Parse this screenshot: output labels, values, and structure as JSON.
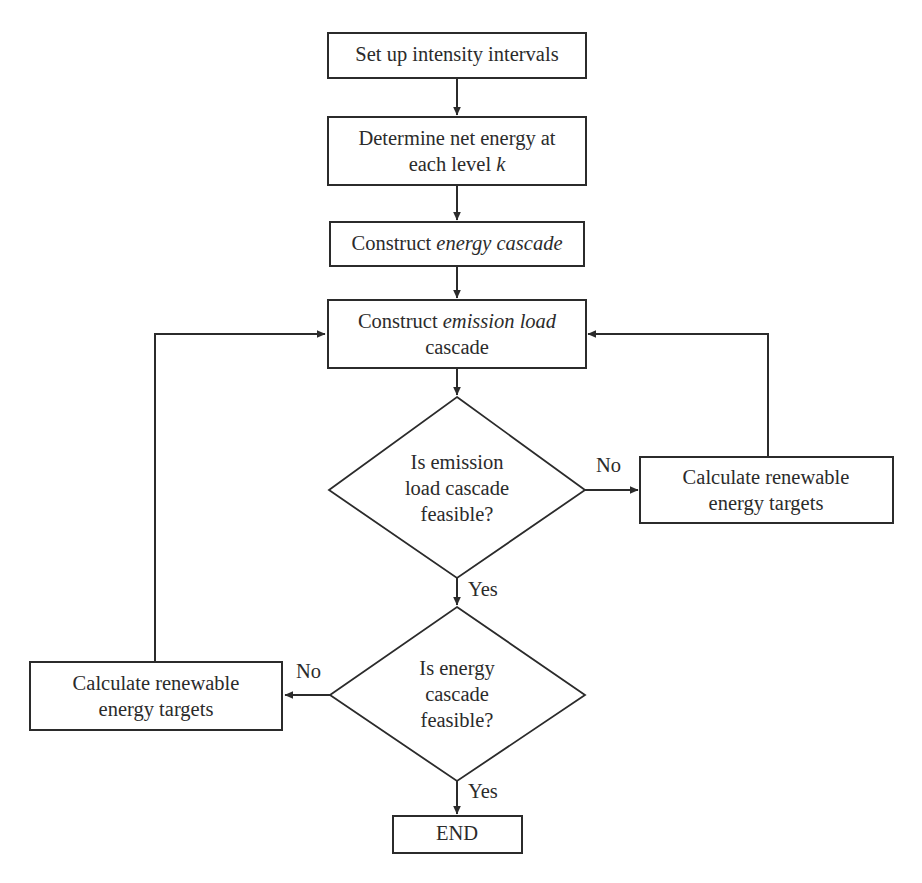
{
  "diagram": {
    "type": "flowchart",
    "stroke_color": "#2b2b2b",
    "fill_color": "#ffffff",
    "background_color": "#ffffff"
  },
  "nodes": {
    "setup": {
      "shape": "process",
      "label": "Set up intensity intervals"
    },
    "determine": {
      "shape": "process",
      "line1": "Determine net energy at",
      "line2_prefix": "each level ",
      "line2_italic": "k"
    },
    "energy_cascade": {
      "shape": "process",
      "prefix": "Construct ",
      "italic": "energy cascade"
    },
    "emission_cascade": {
      "shape": "process",
      "prefix": "Construct ",
      "italic_line1": "emission load",
      "italic_line2": "cascade"
    },
    "decision_emission": {
      "shape": "decision",
      "line1": "Is emission",
      "line2": "load cascade",
      "line3": "feasible?"
    },
    "decision_energy": {
      "shape": "decision",
      "line1": "Is energy",
      "line2": "cascade",
      "line3": "feasible?"
    },
    "renewable_right": {
      "shape": "process",
      "line1": "Calculate renewable",
      "line2": "energy targets"
    },
    "renewable_left": {
      "shape": "process",
      "line1": "Calculate renewable",
      "line2": "energy targets"
    },
    "end": {
      "shape": "terminal",
      "label": "END"
    }
  },
  "edge_labels": {
    "emission_no": "No",
    "emission_yes": "Yes",
    "energy_no": "No",
    "energy_yes": "Yes"
  }
}
